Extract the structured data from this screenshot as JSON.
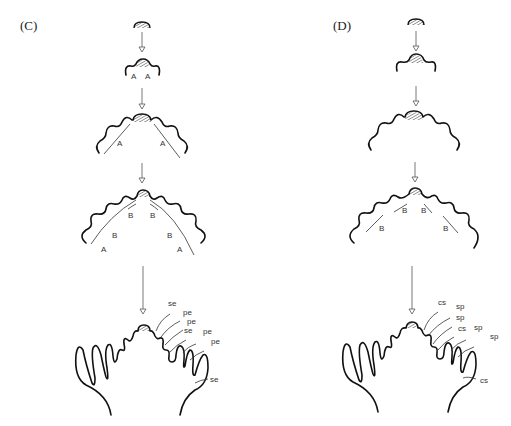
{
  "panels": [
    {
      "id": "C",
      "label": "(C)",
      "stage_labels": {
        "stage2": [
          "A",
          "A"
        ],
        "stage3": [
          "A",
          "A"
        ],
        "stage4": [
          "B",
          "B",
          "B",
          "B",
          "A",
          "A"
        ],
        "stage5": [
          "se",
          "pe",
          "pe",
          "se",
          "pe",
          "pe",
          "se"
        ]
      }
    },
    {
      "id": "D",
      "label": "(D)",
      "stage_labels": {
        "stage4": [
          "B",
          "B",
          "B",
          "B"
        ],
        "stage5": [
          "cs",
          "sp",
          "sp",
          "cs",
          "sp",
          "sp",
          "cs"
        ]
      }
    }
  ]
}
